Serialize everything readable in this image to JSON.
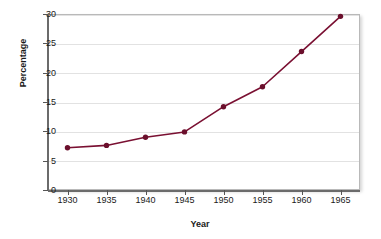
{
  "chart_data": {
    "type": "line",
    "title": "",
    "xlabel": "Year",
    "ylabel": "Percentage",
    "x": [
      1930,
      1935,
      1940,
      1945,
      1950,
      1955,
      1960,
      1965
    ],
    "values": [
      7.2,
      7.6,
      9.0,
      9.9,
      14.2,
      17.6,
      23.6,
      29.6
    ],
    "series": [
      {
        "name": "Percentage",
        "values": [
          7.2,
          7.6,
          9.0,
          9.9,
          14.2,
          17.6,
          23.6,
          29.6
        ]
      }
    ],
    "xtick_labels": [
      "1930",
      "1935",
      "1940",
      "1945",
      "1950",
      "1955",
      "1960",
      "1965"
    ],
    "ytick_labels": [
      "0",
      "5",
      "10",
      "15",
      "20",
      "25",
      "30"
    ],
    "ytick_values": [
      0,
      5,
      10,
      15,
      20,
      25,
      30
    ],
    "xlim": [
      1927.5,
      1967.5
    ],
    "ylim": [
      0,
      30
    ],
    "grid": "horizontal",
    "legend": "none",
    "line_color": "#7a1032",
    "marker_color": "#6b0f2c",
    "marker": "circle",
    "grid_color": "#e2e2e2",
    "plot_background": "#ffffff",
    "axis_color": "#6b6b6b",
    "text_color": "#1a1a1a"
  }
}
